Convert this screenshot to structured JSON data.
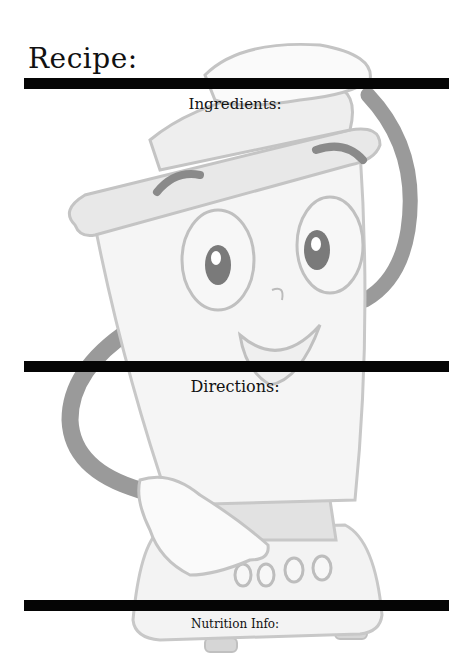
{
  "card": {
    "title": "Recipe:",
    "sections": {
      "ingredients": "Ingredients:",
      "directions": "Directions:",
      "nutrition": "Nutrition Info:"
    }
  },
  "illustration": {
    "subject": "cartoon blender mascot",
    "colors": {
      "outline": "#c8c8c8",
      "fill_light": "#f2f2f2",
      "fill_mid": "#dedede",
      "handle": "#8c8c8c",
      "eye": "#7a7a7a",
      "bar": "#050505"
    }
  }
}
